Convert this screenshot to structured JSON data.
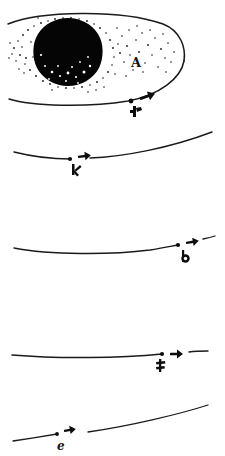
{
  "figure": {
    "background_color": "#ffffff",
    "ink_color": "#1a1a1a",
    "width": 225,
    "height": 456,
    "panel_count": 5
  },
  "panels": [
    {
      "id": "panel-1",
      "name": "comet-head-panel",
      "label": "A",
      "marker_label": "P",
      "has_ellipse": true,
      "has_disc": true,
      "curve_kind": "ellipse-with-nucleus",
      "arrow_direction": "right",
      "ellipse": {
        "cx": 96,
        "cy": 61,
        "rx": 89,
        "ry": 46
      },
      "disc": {
        "cx": 68,
        "cy": 52,
        "r": 34
      },
      "marker": {
        "x": 131,
        "y": 101
      },
      "arrow": {
        "x": 140,
        "y": 99,
        "angle": -22
      }
    },
    {
      "id": "panel-2",
      "name": "trajectory-panel-2",
      "label": "",
      "marker_label": "K",
      "has_ellipse": false,
      "has_disc": false,
      "curve_kind": "shallow-valley",
      "arrow_direction": "right",
      "marker": {
        "x": 70,
        "y": 159
      },
      "arrow": {
        "x": 81,
        "y": 156,
        "angle": -8
      }
    },
    {
      "id": "panel-3",
      "name": "trajectory-panel-3",
      "label": "",
      "marker_label": "b",
      "has_ellipse": false,
      "has_disc": false,
      "curve_kind": "long-shallow-rise",
      "arrow_direction": "right",
      "marker": {
        "x": 178,
        "y": 245
      },
      "arrow": {
        "x": 189,
        "y": 242,
        "angle": -10
      }
    },
    {
      "id": "panel-4",
      "name": "trajectory-panel-4",
      "label": "",
      "marker_label": "f",
      "has_ellipse": false,
      "has_disc": false,
      "curve_kind": "near-straight",
      "arrow_direction": "right",
      "marker": {
        "x": 160,
        "y": 355
      },
      "arrow": {
        "x": 176,
        "y": 355,
        "angle": 0
      }
    },
    {
      "id": "panel-5",
      "name": "trajectory-panel-5",
      "label": "",
      "marker_label": "e",
      "has_ellipse": false,
      "has_disc": false,
      "curve_kind": "two-segment-rise",
      "arrow_direction": "right",
      "marker": {
        "x": 57,
        "y": 434
      },
      "arrow": {
        "x": 68,
        "y": 430,
        "angle": -12
      }
    }
  ],
  "annotations": {
    "region_label": "A",
    "marker_labels": [
      "P",
      "K",
      "b",
      "f",
      "e"
    ],
    "arrow_semantics": "velocity-direction"
  }
}
